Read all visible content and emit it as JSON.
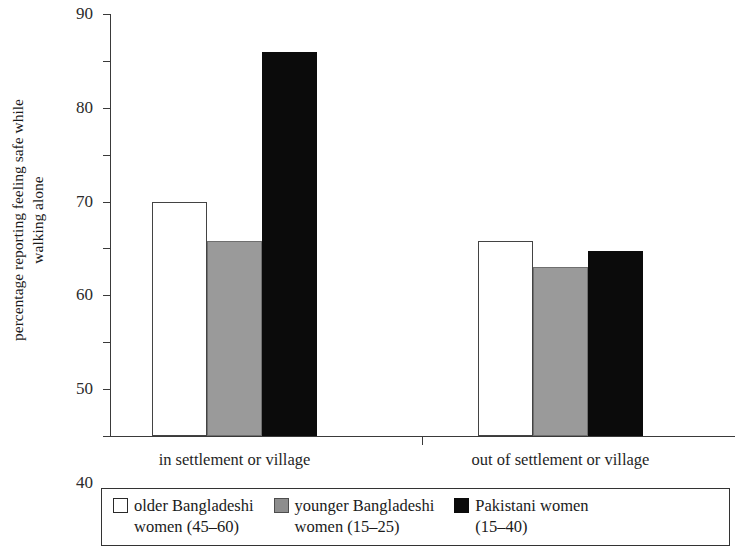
{
  "chart_data": {
    "type": "bar",
    "title": "",
    "xlabel": "",
    "ylabel_line1": "percentage reporting feeling safe while",
    "ylabel_line2": "walking alone",
    "categories": [
      "in settlement or village",
      "out of settlement or village"
    ],
    "series": [
      {
        "name": "older Bangladeshi women (45–60)",
        "values": [
          50,
          41.5
        ],
        "color": "#ffffff"
      },
      {
        "name": "younger Bangladeshi women (15–25)",
        "values": [
          41.5,
          36
        ],
        "color": "#9a9a9a"
      },
      {
        "name": "Pakistani women (15–40)",
        "values": [
          82,
          39.5
        ],
        "color": "#0b0b0b"
      }
    ],
    "ylim": [
      0,
      90
    ],
    "yticks": [
      0,
      10,
      20,
      30,
      40,
      50,
      60,
      70,
      80,
      90
    ],
    "ytick_labels": [
      "0",
      "10",
      "20",
      "30",
      "40",
      "50",
      "60",
      "70",
      "80",
      "90"
    ],
    "grid": false,
    "legend_position": "bottom"
  },
  "legend": {
    "items": [
      {
        "swatch": "white",
        "line1": "older Bangladeshi",
        "line2": "women (45–60)"
      },
      {
        "swatch": "gray",
        "line1": "younger Bangladeshi",
        "line2": "women (15–25)"
      },
      {
        "swatch": "black",
        "line1": "Pakistani women",
        "line2": "(15–40)"
      }
    ]
  }
}
